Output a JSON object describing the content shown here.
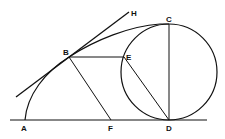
{
  "diagram": {
    "type": "geometry-construction",
    "labels": {
      "A": "A",
      "B": "B",
      "C": "C",
      "D": "D",
      "E": "E",
      "F": "F",
      "H": "H"
    },
    "elements": [
      {
        "kind": "line",
        "name": "baseline",
        "through": [
          "A",
          "F",
          "D"
        ]
      },
      {
        "kind": "circle",
        "name": "generating-circle",
        "through": [
          "C",
          "E",
          "D"
        ]
      },
      {
        "kind": "segment",
        "name": "CD",
        "from": "C",
        "to": "D"
      },
      {
        "kind": "segment",
        "name": "BE",
        "from": "B",
        "to": "E"
      },
      {
        "kind": "segment",
        "name": "BF",
        "from": "B",
        "to": "F"
      },
      {
        "kind": "segment",
        "name": "ED",
        "from": "E",
        "to": "D"
      },
      {
        "kind": "line",
        "name": "tangent-BH",
        "through": [
          "B",
          "H"
        ]
      },
      {
        "kind": "curve",
        "name": "cycloid-arc",
        "from": "A",
        "to": "C",
        "through": [
          "B"
        ]
      }
    ]
  }
}
